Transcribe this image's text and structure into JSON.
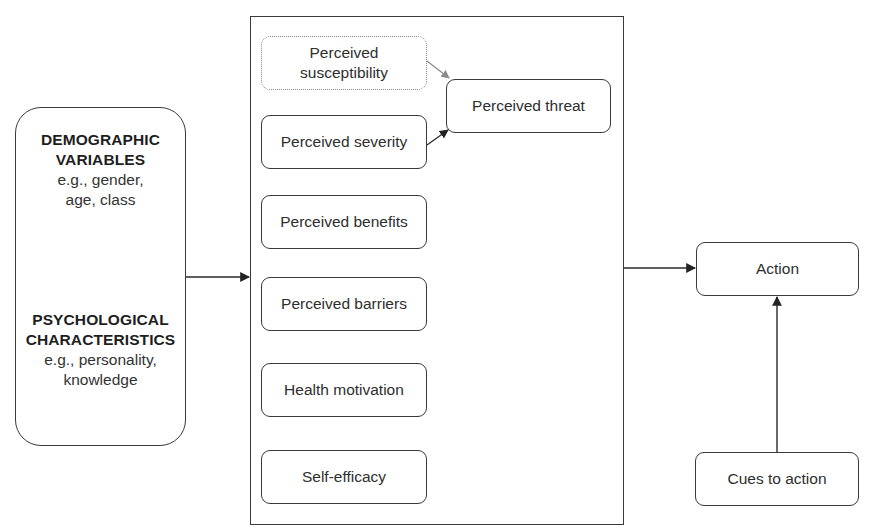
{
  "diagram": {
    "left_box": {
      "groups": [
        {
          "heading_line1": "DEMOGRAPHIC",
          "heading_line2": "VARIABLES",
          "example_line1": "e.g., gender,",
          "example_line2": "age, class"
        },
        {
          "heading_line1": "PSYCHOLOGICAL",
          "heading_line2": "CHARACTERISTICS",
          "example_line1": "e.g., personality,",
          "example_line2": "knowledge"
        }
      ]
    },
    "central_frame": {
      "boxes": [
        {
          "id": "susceptibility",
          "label_line1": "Perceived",
          "label_line2": "susceptibility",
          "style": "dotted"
        },
        {
          "id": "severity",
          "label": "Perceived severity"
        },
        {
          "id": "benefits",
          "label": "Perceived benefits"
        },
        {
          "id": "barriers",
          "label": "Perceived barriers"
        },
        {
          "id": "motivation",
          "label": "Health motivation"
        },
        {
          "id": "self_efficacy",
          "label": "Self-efficacy"
        }
      ],
      "threat_box": {
        "label": "Perceived threat"
      }
    },
    "action_box": {
      "label": "Action"
    },
    "cues_box": {
      "label": "Cues to action"
    },
    "edges": [
      {
        "from": "left_box",
        "to": "central_frame"
      },
      {
        "from": "susceptibility",
        "to": "threat_box",
        "color": "#8a8a8a"
      },
      {
        "from": "severity",
        "to": "threat_box",
        "color": "#2a2a2a"
      },
      {
        "from": "central_frame",
        "to": "action_box"
      },
      {
        "from": "cues_box",
        "to": "action_box"
      }
    ],
    "colors": {
      "stroke": "#3a3a3a",
      "dotted_stroke": "#8a8a8a",
      "text": "#2e2e2e",
      "background": "#ffffff"
    }
  }
}
